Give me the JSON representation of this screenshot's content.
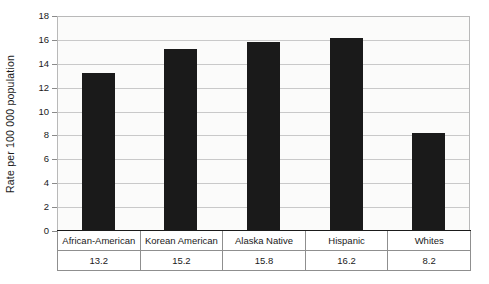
{
  "chart_data": {
    "type": "bar",
    "title": "",
    "xlabel": "",
    "ylabel": "Rate per 100 000 population",
    "categories": [
      "African-American",
      "Korean American",
      "Alaska Native",
      "Hispanic",
      "Whites"
    ],
    "values": [
      13.2,
      15.2,
      15.8,
      16.2,
      8.2
    ],
    "value_labels": [
      "13.2",
      "15.2",
      "15.8",
      "16.2",
      "8.2"
    ],
    "ylim": [
      0,
      18
    ],
    "yticks": [
      18,
      16,
      14,
      12,
      10,
      8,
      6,
      4,
      2,
      0
    ],
    "ytick_labels": [
      "18",
      "16",
      "14",
      "12",
      "10",
      "8",
      "6",
      "4",
      "2",
      "0"
    ],
    "grid": true,
    "legend": "none",
    "bar_color": "#1a1a1a",
    "plot_background": "#fbfbfa",
    "gridline_color": "#c9c9c9"
  },
  "figure": {
    "y_axis_title": "Rate per 100 000 population",
    "caption_remnant": ""
  },
  "table": {
    "label_row": [
      "African-American",
      "Korean American",
      "Alaska Native",
      "Hispanic",
      "Whites"
    ],
    "value_row": [
      "13.2",
      "15.2",
      "15.8",
      "16.2",
      "8.2"
    ]
  }
}
